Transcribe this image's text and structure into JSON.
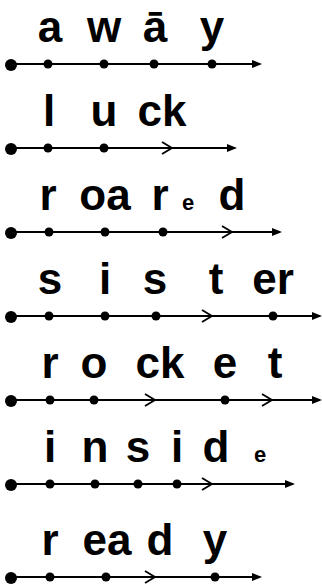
{
  "colors": {
    "ink": "#000000",
    "background": "#ffffff"
  },
  "words": [
    {
      "word": "away",
      "line_y": 64,
      "arrow_end": 262,
      "dots": [
        48,
        104,
        154,
        212
      ],
      "chevrons": [],
      "segments": [
        {
          "text": "a",
          "x": 50,
          "small": false
        },
        {
          "text": "w",
          "x": 104,
          "small": false
        },
        {
          "text": "ā",
          "x": 155,
          "small": false
        },
        {
          "text": "y",
          "x": 212,
          "small": false
        }
      ]
    },
    {
      "word": "luck",
      "line_y": 148,
      "arrow_end": 237,
      "dots": [
        48,
        104
      ],
      "chevrons": [
        172
      ],
      "segments": [
        {
          "text": "l",
          "x": 49,
          "small": false
        },
        {
          "text": "u",
          "x": 104,
          "small": false
        },
        {
          "text": "ck",
          "x": 162,
          "small": false
        }
      ]
    },
    {
      "word": "roared",
      "line_y": 232,
      "arrow_end": 282,
      "dots": [
        49,
        105,
        163
      ],
      "chevrons": [
        232
      ],
      "segments": [
        {
          "text": "r",
          "x": 48,
          "small": false
        },
        {
          "text": "oa",
          "x": 105,
          "small": false
        },
        {
          "text": "r",
          "x": 160,
          "small": false
        },
        {
          "text": "e",
          "x": 188,
          "small": true
        },
        {
          "text": "d",
          "x": 232,
          "small": false
        }
      ]
    },
    {
      "word": "sister",
      "line_y": 316,
      "arrow_end": 322,
      "dots": [
        49,
        105,
        156,
        273
      ],
      "chevrons": [
        212
      ],
      "segments": [
        {
          "text": "s",
          "x": 50,
          "small": false
        },
        {
          "text": "i",
          "x": 105,
          "small": false
        },
        {
          "text": "s",
          "x": 155,
          "small": false
        },
        {
          "text": "t",
          "x": 216,
          "small": false
        },
        {
          "text": "er",
          "x": 273,
          "small": false
        }
      ]
    },
    {
      "word": "rocket",
      "line_y": 400,
      "arrow_end": 322,
      "dots": [
        50,
        94,
        225
      ],
      "chevrons": [
        155,
        272
      ],
      "segments": [
        {
          "text": "r",
          "x": 50,
          "small": false
        },
        {
          "text": "o",
          "x": 94,
          "small": false
        },
        {
          "text": "ck",
          "x": 160,
          "small": false
        },
        {
          "text": "e",
          "x": 225,
          "small": false
        },
        {
          "text": "t",
          "x": 275,
          "small": false
        }
      ]
    },
    {
      "word": "inside",
      "line_y": 484,
      "arrow_end": 295,
      "dots": [
        50,
        95,
        138,
        177
      ],
      "chevrons": [
        212
      ],
      "segments": [
        {
          "text": "i",
          "x": 50,
          "small": false
        },
        {
          "text": "n",
          "x": 95,
          "small": false
        },
        {
          "text": "s",
          "x": 138,
          "small": false
        },
        {
          "text": "i",
          "x": 177,
          "small": false
        },
        {
          "text": "d",
          "x": 216,
          "small": false
        },
        {
          "text": "e",
          "x": 260,
          "small": true
        }
      ]
    },
    {
      "word": "ready",
      "line_y": 577,
      "arrow_end": 262,
      "dots": [
        50,
        106,
        215
      ],
      "chevrons": [
        155
      ],
      "segments": [
        {
          "text": "r",
          "x": 50,
          "small": false
        },
        {
          "text": "ea",
          "x": 107,
          "small": false
        },
        {
          "text": "d",
          "x": 160,
          "small": false
        },
        {
          "text": "y",
          "x": 215,
          "small": false
        }
      ]
    }
  ]
}
